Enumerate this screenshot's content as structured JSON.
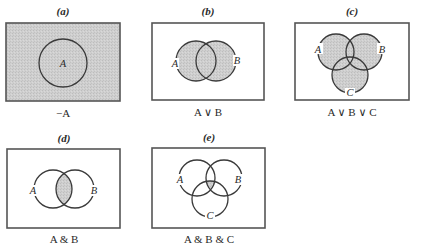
{
  "figure": {
    "panels": [
      {
        "id": "a",
        "heading": "(a)",
        "caption": "−A",
        "description": "Complement of A: region outside circle A shaded",
        "circles": [
          {
            "label": "A",
            "cx": 63,
            "cy": 63,
            "r": 24
          }
        ],
        "shaded_region": "outside-A"
      },
      {
        "id": "b",
        "heading": "(b)",
        "caption": "A ∨ B",
        "description": "Union of A and B shaded",
        "circles": [
          {
            "label": "A",
            "cx": 196,
            "cy": 61,
            "r": 20
          },
          {
            "label": "B",
            "cx": 216,
            "cy": 61,
            "r": 20
          }
        ],
        "shaded_region": "A-or-B"
      },
      {
        "id": "c",
        "heading": "(c)",
        "caption": "A ∨ B ∨ C",
        "description": "Union of A, B and C shaded",
        "circles": [
          {
            "label": "A",
            "cx": 336,
            "cy": 52,
            "r": 18
          },
          {
            "label": "B",
            "cx": 364,
            "cy": 52,
            "r": 18
          },
          {
            "label": "C",
            "cx": 350,
            "cy": 75,
            "r": 18
          }
        ],
        "shaded_region": "A-or-B-or-C"
      },
      {
        "id": "d",
        "heading": "(d)",
        "caption": "A & B",
        "description": "Intersection of A and B shaded",
        "circles": [
          {
            "label": "A",
            "cx": 53,
            "cy": 189,
            "r": 19
          },
          {
            "label": "B",
            "cx": 75,
            "cy": 189,
            "r": 19
          }
        ],
        "shaded_region": "A-and-B"
      },
      {
        "id": "e",
        "heading": "(e)",
        "caption": "A & B & C",
        "description": "Intersection of A, B and C shaded",
        "circles": [
          {
            "label": "A",
            "cx": 197,
            "cy": 178,
            "r": 18
          },
          {
            "label": "B",
            "cx": 224,
            "cy": 178,
            "r": 18
          },
          {
            "label": "C",
            "cx": 210,
            "cy": 199,
            "r": 18
          }
        ],
        "shaded_region": "A-and-B-and-C"
      }
    ]
  },
  "colors": {
    "shade": "#c9c9c9",
    "stroke": "#3a3a3a",
    "box": "#555555",
    "background": "#ffffff"
  }
}
